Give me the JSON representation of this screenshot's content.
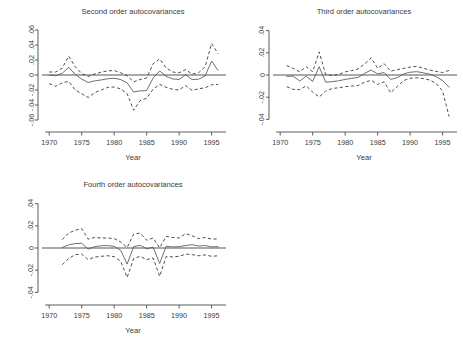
{
  "figure": {
    "background": "#ffffff",
    "panel_count": 3,
    "line_colors": {
      "center": "#555555",
      "band": "#2f2f2f",
      "zero": "#8e8e8e",
      "axis": "#4a4a4a"
    }
  },
  "chart_data": [
    {
      "type": "line",
      "title": "Second order autocovariances",
      "xlabel": "Year",
      "ylabel": "",
      "xlim": [
        1969.2,
        1996.6
      ],
      "ylim": [
        -0.068,
        0.068
      ],
      "xticks": [
        1970,
        1975,
        1980,
        1985,
        1990,
        1995
      ],
      "xticklabels": [
        "1970",
        "1975",
        "1980",
        "1985",
        "1990",
        "1995"
      ],
      "yticks": [
        -0.06,
        -0.04,
        -0.02,
        0,
        0.02,
        0.04,
        0.06
      ],
      "yticklabels": [
        "-.06",
        "-.04",
        "-.02",
        "0",
        ".02",
        ".04",
        ".06"
      ],
      "grid": false,
      "legend": "none",
      "reference_line": 0,
      "x": [
        1970,
        1971,
        1972,
        1973,
        1974,
        1975,
        1976,
        1977,
        1978,
        1979,
        1980,
        1981,
        1982,
        1983,
        1984,
        1985,
        1986,
        1987,
        1988,
        1989,
        1990,
        1991,
        1992,
        1993,
        1994,
        1995,
        1996
      ],
      "series": [
        {
          "name": "estimate",
          "style": "solid",
          "values": [
            0.0,
            -0.001,
            0.0022,
            0.0103,
            0.0009,
            -0.0055,
            -0.01,
            -0.0078,
            -0.0066,
            -0.005,
            -0.0043,
            -0.006,
            -0.0105,
            -0.0226,
            -0.0212,
            -0.0208,
            -0.004,
            0.0055,
            -0.0018,
            -0.0052,
            -0.006,
            0.0003,
            -0.0062,
            -0.0055,
            -0.0012,
            0.0186,
            0.006
          ]
        },
        {
          "name": "upper-confidence-band",
          "style": "dashed",
          "values": [
            0.004,
            0.004,
            0.009,
            0.0252,
            0.011,
            0.002,
            -0.002,
            0.0012,
            0.0038,
            0.0055,
            0.006,
            0.003,
            -0.001,
            -0.009,
            -0.006,
            -0.004,
            0.015,
            0.0215,
            0.0095,
            0.004,
            0.003,
            0.0072,
            0.0012,
            0.003,
            0.011,
            0.042,
            0.0285
          ]
        },
        {
          "name": "lower-confidence-band",
          "style": "dashed",
          "values": [
            -0.0115,
            -0.015,
            -0.0105,
            -0.0085,
            -0.02,
            -0.025,
            -0.03,
            -0.0235,
            -0.02,
            -0.0165,
            -0.016,
            -0.0185,
            -0.025,
            -0.047,
            -0.034,
            -0.031,
            -0.019,
            -0.0125,
            -0.0165,
            -0.019,
            -0.02,
            -0.014,
            -0.0205,
            -0.0185,
            -0.017,
            -0.013,
            -0.0125
          ]
        }
      ]
    },
    {
      "type": "line",
      "title": "Third order autocovariances",
      "xlabel": "Year",
      "ylabel": "",
      "xlim": [
        1969.2,
        1996.6
      ],
      "ylim": [
        -0.046,
        0.046
      ],
      "xticks": [
        1970,
        1975,
        1980,
        1985,
        1990,
        1995
      ],
      "xticklabels": [
        "1970",
        "1975",
        "1980",
        "1985",
        "1990",
        "1995"
      ],
      "yticks": [
        -0.04,
        -0.02,
        0,
        0.02,
        0.04
      ],
      "yticklabels": [
        "-.04",
        "-.02",
        "0",
        ".02",
        ".04"
      ],
      "grid": false,
      "legend": "none",
      "reference_line": 0,
      "x": [
        1971,
        1972,
        1973,
        1974,
        1975,
        1976,
        1977,
        1978,
        1979,
        1980,
        1981,
        1982,
        1983,
        1984,
        1985,
        1986,
        1987,
        1988,
        1989,
        1990,
        1991,
        1992,
        1993,
        1994,
        1995,
        1996
      ],
      "series": [
        {
          "name": "estimate",
          "style": "solid",
          "values": [
            -0.0012,
            -0.001,
            -0.0055,
            -0.001,
            -0.0058,
            0.0075,
            -0.0065,
            -0.006,
            -0.0052,
            -0.004,
            -0.003,
            -0.0022,
            0.0015,
            0.0045,
            0.001,
            0.0022,
            -0.004,
            -0.0025,
            0.001,
            0.0025,
            0.003,
            0.002,
            0.0008,
            -0.0015,
            -0.005,
            -0.011
          ]
        },
        {
          "name": "upper-confidence-band",
          "style": "dashed",
          "values": [
            0.0085,
            0.006,
            0.0028,
            0.0075,
            0.003,
            0.0208,
            0.0005,
            -0.0005,
            0.0005,
            0.0028,
            0.004,
            0.0055,
            0.01,
            0.0155,
            0.006,
            0.0102,
            0.0035,
            0.0048,
            0.006,
            0.0072,
            0.0078,
            0.0062,
            0.0045,
            0.0032,
            0.0022,
            0.0042
          ]
        },
        {
          "name": "lower-confidence-band",
          "style": "dashed",
          "values": [
            -0.0105,
            -0.013,
            -0.0132,
            -0.0098,
            -0.0155,
            -0.0198,
            -0.0145,
            -0.0122,
            -0.0115,
            -0.0105,
            -0.01,
            -0.0095,
            -0.0065,
            -0.0048,
            -0.0085,
            -0.0062,
            -0.016,
            -0.0105,
            -0.005,
            -0.003,
            -0.0025,
            -0.0032,
            -0.0045,
            -0.0075,
            -0.0145,
            -0.0375
          ]
        }
      ]
    },
    {
      "type": "line",
      "title": "Fourth order autocovariances",
      "xlabel": "Year",
      "ylabel": "",
      "xlim": [
        1969.2,
        1996.6
      ],
      "ylim": [
        -0.046,
        0.046
      ],
      "xticks": [
        1970,
        1975,
        1980,
        1985,
        1990,
        1995
      ],
      "xticklabels": [
        "1970",
        "1975",
        "1980",
        "1985",
        "1990",
        "1995"
      ],
      "yticks": [
        -0.04,
        -0.02,
        0,
        0.02,
        0.04
      ],
      "yticklabels": [
        "-.04",
        "-.02",
        "0",
        ".02",
        ".04"
      ],
      "grid": false,
      "legend": "none",
      "reference_line": 0,
      "x": [
        1972,
        1973,
        1974,
        1975,
        1976,
        1977,
        1978,
        1979,
        1980,
        1981,
        1982,
        1983,
        1984,
        1985,
        1986,
        1987,
        1988,
        1989,
        1990,
        1991,
        1992,
        1993,
        1994,
        1995,
        1996
      ],
      "series": [
        {
          "name": "estimate",
          "style": "solid",
          "values": [
            0.0005,
            0.0028,
            0.004,
            0.0042,
            -0.001,
            0.0012,
            0.002,
            0.0022,
            0.0015,
            -0.002,
            -0.0145,
            0.0012,
            0.0025,
            -0.0008,
            0.0008,
            -0.014,
            0.0015,
            0.001,
            0.0012,
            0.0022,
            0.003,
            0.0018,
            0.0022,
            0.001,
            0.0012
          ]
        },
        {
          "name": "upper-confidence-band",
          "style": "dashed",
          "values": [
            0.0075,
            0.0135,
            0.016,
            0.0175,
            0.008,
            0.0095,
            0.009,
            0.009,
            0.0085,
            0.0055,
            0.0005,
            0.0125,
            0.0135,
            0.007,
            0.009,
            0.0002,
            0.0105,
            0.0095,
            0.009,
            0.013,
            0.011,
            0.0085,
            0.0095,
            0.008,
            0.0082
          ]
        },
        {
          "name": "lower-confidence-band",
          "style": "dashed",
          "values": [
            -0.015,
            -0.0095,
            -0.006,
            -0.0055,
            -0.0105,
            -0.0082,
            -0.0075,
            -0.007,
            -0.0078,
            -0.012,
            -0.0265,
            -0.0095,
            -0.0075,
            -0.0105,
            -0.009,
            -0.0255,
            -0.0078,
            -0.008,
            -0.0075,
            -0.0055,
            -0.006,
            -0.007,
            -0.0062,
            -0.0075,
            -0.007
          ]
        }
      ]
    }
  ]
}
